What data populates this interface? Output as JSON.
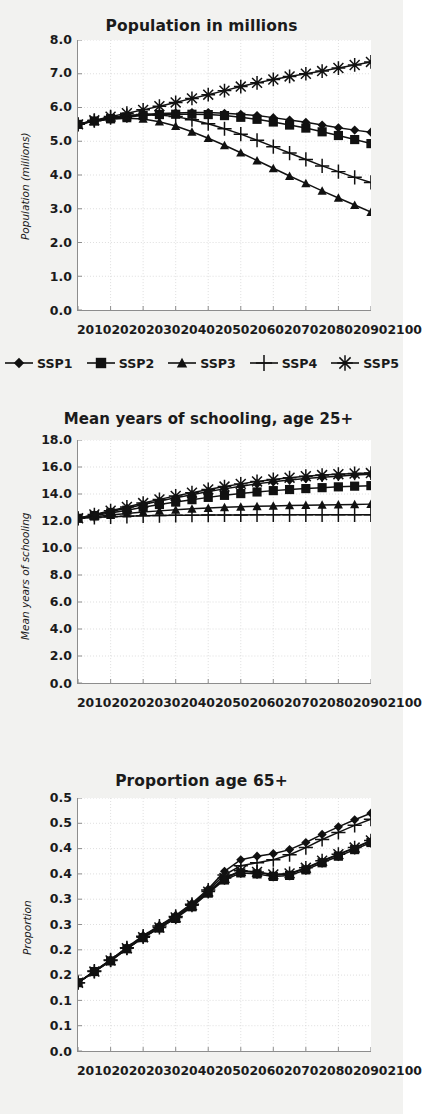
{
  "figure": {
    "background_color": "#f2f2f0",
    "plot_background_color": "#ffffff",
    "series_color": "#111111",
    "grid_color": "#cfcfcf"
  },
  "legend": {
    "position": "below-first-panel",
    "items": [
      {
        "label": "SSP1",
        "marker": "diamond-marker"
      },
      {
        "label": "SSP2",
        "marker": "square-marker"
      },
      {
        "label": "SSP3",
        "marker": "triangle-marker"
      },
      {
        "label": "SSP4",
        "marker": "plus-marker"
      },
      {
        "label": "SSP5",
        "marker": "asterisk-marker"
      }
    ]
  },
  "chart_data": [
    {
      "id": "population",
      "type": "line",
      "title": "Population in millions",
      "xlabel": "",
      "ylabel": "Population (millions)",
      "x": [
        2010,
        2015,
        2020,
        2025,
        2030,
        2035,
        2040,
        2045,
        2050,
        2055,
        2060,
        2065,
        2070,
        2075,
        2080,
        2085,
        2090,
        2095,
        2100
      ],
      "xticklabels": [
        "2010",
        "2020",
        "2030",
        "2040",
        "2050",
        "2060",
        "2070",
        "2080",
        "2090",
        "2100"
      ],
      "yticklabels": [
        "8.0",
        "7.0",
        "6.0",
        "5.0",
        "4.0",
        "3.0",
        "2.0",
        "1.0",
        "0.0"
      ],
      "ylim": [
        0.0,
        8.0
      ],
      "xlim": [
        2010,
        2100
      ],
      "grid": true,
      "series": [
        {
          "name": "SSP1",
          "marker": "diamond-marker",
          "values": [
            5.5,
            5.6,
            5.68,
            5.74,
            5.79,
            5.82,
            5.84,
            5.85,
            5.85,
            5.83,
            5.8,
            5.76,
            5.7,
            5.63,
            5.56,
            5.48,
            5.4,
            5.33,
            5.27
          ]
        },
        {
          "name": "SSP2",
          "marker": "square-marker",
          "values": [
            5.5,
            5.6,
            5.67,
            5.72,
            5.76,
            5.79,
            5.8,
            5.8,
            5.79,
            5.76,
            5.71,
            5.65,
            5.57,
            5.48,
            5.39,
            5.28,
            5.17,
            5.05,
            4.93
          ]
        },
        {
          "name": "SSP3",
          "marker": "triangle-marker",
          "values": [
            5.5,
            5.59,
            5.65,
            5.68,
            5.66,
            5.58,
            5.45,
            5.28,
            5.09,
            4.88,
            4.66,
            4.43,
            4.2,
            3.97,
            3.75,
            3.53,
            3.32,
            3.11,
            2.9
          ]
        },
        {
          "name": "SSP4",
          "marker": "plus-marker",
          "values": [
            5.5,
            5.61,
            5.7,
            5.76,
            5.79,
            5.78,
            5.73,
            5.64,
            5.52,
            5.37,
            5.21,
            5.03,
            4.84,
            4.65,
            4.46,
            4.27,
            4.1,
            3.93,
            3.78
          ]
        },
        {
          "name": "SSP5",
          "marker": "asterisk-marker",
          "values": [
            5.5,
            5.62,
            5.73,
            5.83,
            5.93,
            6.04,
            6.15,
            6.27,
            6.38,
            6.5,
            6.62,
            6.73,
            6.83,
            6.92,
            7.0,
            7.08,
            7.17,
            7.26,
            7.35
          ]
        }
      ]
    },
    {
      "id": "schooling",
      "type": "line",
      "title": "Mean years of schooling, age 25+",
      "xlabel": "",
      "ylabel": "Mean years of schooling",
      "x": [
        2010,
        2015,
        2020,
        2025,
        2030,
        2035,
        2040,
        2045,
        2050,
        2055,
        2060,
        2065,
        2070,
        2075,
        2080,
        2085,
        2090,
        2095,
        2100
      ],
      "xticklabels": [
        "2010",
        "2020",
        "2030",
        "2040",
        "2050",
        "2060",
        "2070",
        "2080",
        "2090",
        "2100"
      ],
      "yticklabels": [
        "18.0",
        "16.0",
        "14.0",
        "12.0",
        "10.0",
        "8.0",
        "6.0",
        "4.0",
        "2.0",
        "0.0"
      ],
      "ylim": [
        0.0,
        18.0
      ],
      "xlim": [
        2010,
        2100
      ],
      "grid": true,
      "series": [
        {
          "name": "SSP1",
          "marker": "diamond-marker",
          "values": [
            12.2,
            12.45,
            12.7,
            12.95,
            13.22,
            13.48,
            13.72,
            13.95,
            14.18,
            14.38,
            14.57,
            14.75,
            14.9,
            15.03,
            15.14,
            15.24,
            15.32,
            15.4,
            15.47
          ]
        },
        {
          "name": "SSP2",
          "marker": "square-marker",
          "values": [
            12.2,
            12.4,
            12.6,
            12.8,
            13.02,
            13.22,
            13.4,
            13.58,
            13.75,
            13.9,
            14.03,
            14.15,
            14.25,
            14.33,
            14.4,
            14.47,
            14.53,
            14.58,
            14.62
          ]
        },
        {
          "name": "SSP3",
          "marker": "triangle-marker",
          "values": [
            12.2,
            12.32,
            12.44,
            12.55,
            12.66,
            12.75,
            12.83,
            12.9,
            12.96,
            13.01,
            13.05,
            13.09,
            13.12,
            13.15,
            13.17,
            13.19,
            13.21,
            13.23,
            13.25
          ]
        },
        {
          "name": "SSP4",
          "marker": "plus-marker",
          "values": [
            12.2,
            12.26,
            12.31,
            12.35,
            12.38,
            12.4,
            12.42,
            12.43,
            12.44,
            12.45,
            12.45,
            12.46,
            12.46,
            12.46,
            12.46,
            12.46,
            12.46,
            12.46,
            12.46
          ]
        },
        {
          "name": "SSP5",
          "marker": "asterisk-marker",
          "values": [
            12.2,
            12.48,
            12.76,
            13.04,
            13.33,
            13.6,
            13.86,
            14.1,
            14.34,
            14.55,
            14.75,
            14.93,
            15.08,
            15.21,
            15.32,
            15.4,
            15.47,
            15.52,
            15.55
          ]
        }
      ]
    },
    {
      "id": "elderly",
      "type": "line",
      "title": "Proportion age 65+",
      "xlabel": "",
      "ylabel": "Proportion",
      "x": [
        2010,
        2015,
        2020,
        2025,
        2030,
        2035,
        2040,
        2045,
        2050,
        2055,
        2060,
        2065,
        2070,
        2075,
        2080,
        2085,
        2090,
        2095,
        2100
      ],
      "xticklabels": [
        "2010",
        "2020",
        "2030",
        "2040",
        "2050",
        "2060",
        "2070",
        "2080",
        "2090",
        "2100"
      ],
      "yticklabels": [
        "0.5",
        "0.5",
        "0.4",
        "0.4",
        "0.3",
        "0.3",
        "0.2",
        "0.2",
        "0.1",
        "0.1",
        "0.0"
      ],
      "ytickvalues": [
        0.5,
        0.45,
        0.4,
        0.35,
        0.3,
        0.25,
        0.2,
        0.15,
        0.1,
        0.05,
        0.0
      ],
      "ylim": [
        0.0,
        0.5
      ],
      "xlim": [
        2010,
        2100
      ],
      "grid": true,
      "series": [
        {
          "name": "SSP1",
          "marker": "diamond-marker",
          "values": [
            0.135,
            0.158,
            0.18,
            0.205,
            0.228,
            0.248,
            0.268,
            0.292,
            0.32,
            0.355,
            0.378,
            0.385,
            0.39,
            0.398,
            0.412,
            0.428,
            0.443,
            0.457,
            0.47
          ]
        },
        {
          "name": "SSP2",
          "marker": "square-marker",
          "values": [
            0.135,
            0.157,
            0.178,
            0.202,
            0.224,
            0.243,
            0.262,
            0.285,
            0.312,
            0.338,
            0.352,
            0.35,
            0.345,
            0.347,
            0.358,
            0.372,
            0.385,
            0.398,
            0.412
          ]
        },
        {
          "name": "SSP3",
          "marker": "triangle-marker",
          "values": [
            0.135,
            0.157,
            0.178,
            0.202,
            0.224,
            0.244,
            0.263,
            0.287,
            0.314,
            0.341,
            0.355,
            0.353,
            0.348,
            0.35,
            0.361,
            0.375,
            0.388,
            0.401,
            0.415
          ]
        },
        {
          "name": "SSP4",
          "marker": "plus-marker",
          "values": [
            0.135,
            0.158,
            0.18,
            0.204,
            0.227,
            0.247,
            0.266,
            0.29,
            0.318,
            0.348,
            0.366,
            0.372,
            0.378,
            0.388,
            0.402,
            0.418,
            0.432,
            0.446,
            0.458
          ]
        },
        {
          "name": "SSP5",
          "marker": "asterisk-marker",
          "values": [
            0.135,
            0.157,
            0.179,
            0.203,
            0.225,
            0.244,
            0.264,
            0.288,
            0.315,
            0.342,
            0.356,
            0.354,
            0.349,
            0.351,
            0.362,
            0.376,
            0.389,
            0.402,
            0.416
          ]
        }
      ]
    }
  ]
}
